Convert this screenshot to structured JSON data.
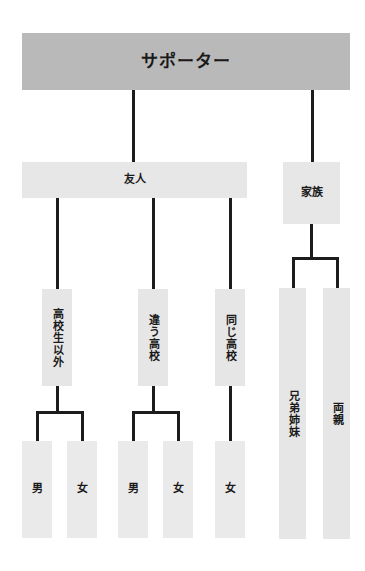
{
  "diagram": {
    "title": "サポーター",
    "type": "tree",
    "orientation": "top-down",
    "colors": {
      "root_fill": "#b9b9b9",
      "branch_fill": "#e7e7e7",
      "leaf_fill": "#eaeaea",
      "connector": "#1c1c1c",
      "text": "#1a1a1a",
      "background": "#ffffff"
    },
    "nodes": {
      "root": {
        "label": "サポーター",
        "level": 1
      },
      "friends": {
        "label": "友人",
        "level": 2
      },
      "family": {
        "label": "家族",
        "level": 2
      },
      "non_highschool": {
        "label": "高校生以外",
        "level": 3
      },
      "different_highschool": {
        "label": "違う高校",
        "level": 3
      },
      "same_highschool": {
        "label": "同じ高校",
        "level": 3
      },
      "siblings": {
        "label": "兄弟姉妹",
        "level": 3
      },
      "parents": {
        "label": "両親",
        "level": 3
      },
      "nonhs_male": {
        "label": "男",
        "level": 4
      },
      "nonhs_female": {
        "label": "女",
        "level": 4
      },
      "diffhs_male": {
        "label": "男",
        "level": 4
      },
      "diffhs_female": {
        "label": "女",
        "level": 4
      },
      "samehs_female": {
        "label": "女",
        "level": 4
      }
    }
  }
}
